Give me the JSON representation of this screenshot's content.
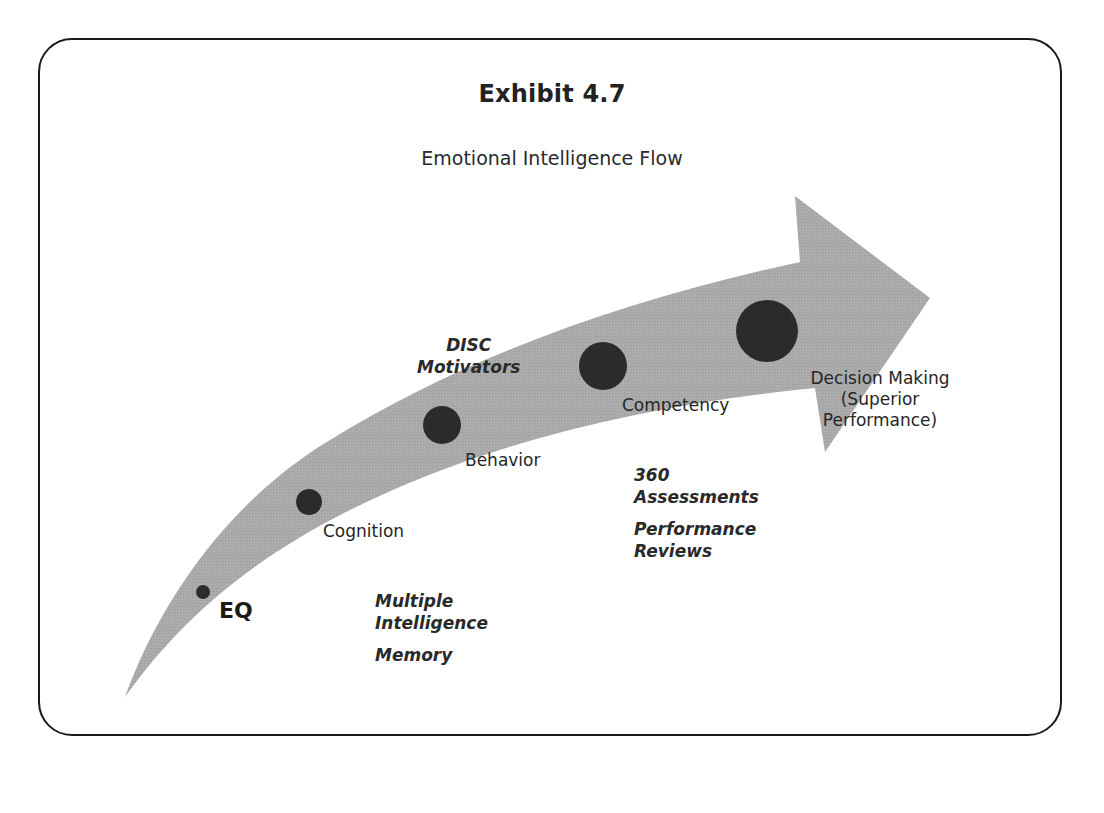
{
  "exhibit": {
    "title": "Exhibit 4.7",
    "subtitle": "Emotional Intelligence Flow"
  },
  "colors": {
    "arrow_fill": "#a9a9a9",
    "dot_fill": "#2b2b2b",
    "frame_stroke": "#1a1a1a",
    "text": "#262626"
  },
  "flow": {
    "stages": [
      {
        "id": "eq",
        "label": "EQ",
        "dot_size": "smallest"
      },
      {
        "id": "cognition",
        "label": "Cognition",
        "dot_size": "small"
      },
      {
        "id": "behavior",
        "label": "Behavior",
        "dot_size": "medium"
      },
      {
        "id": "competency",
        "label": "Competency",
        "dot_size": "large"
      },
      {
        "id": "decision",
        "label_lines": [
          "Decision Making",
          "(Superior",
          "Performance)"
        ],
        "dot_size": "largest"
      }
    ]
  },
  "notes": {
    "disc": [
      "DISC",
      "Motivators"
    ],
    "multiple": [
      "Multiple",
      "Intelligence"
    ],
    "memory": "Memory",
    "assessments": [
      "360",
      "Assessments"
    ],
    "reviews": [
      "Performance",
      "Reviews"
    ]
  }
}
